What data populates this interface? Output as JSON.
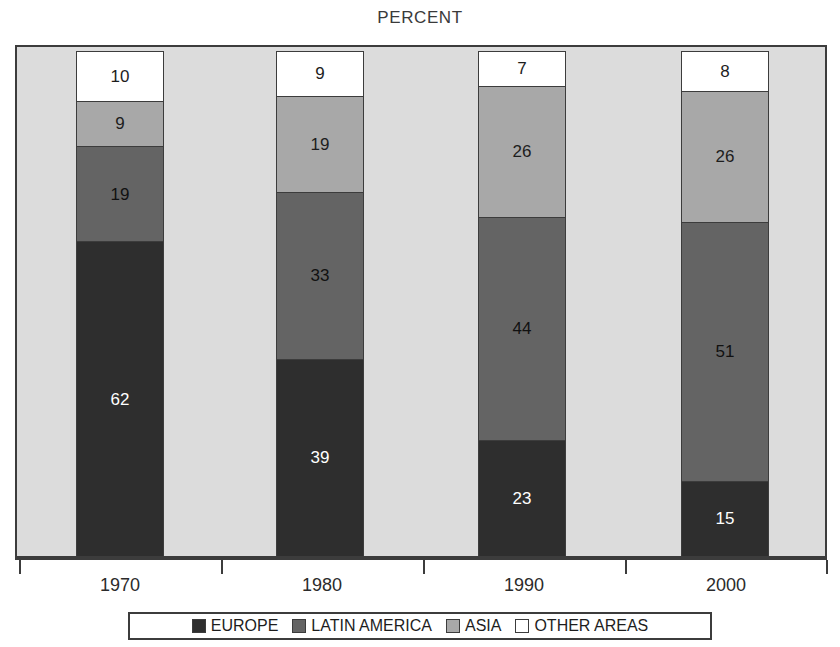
{
  "chart_data": {
    "type": "bar",
    "subtype": "stacked-bar-100-percent",
    "title": "PERCENT",
    "xlabel": "",
    "ylabel": "",
    "ylim": [
      0,
      100
    ],
    "grid": false,
    "legend_position": "bottom",
    "categories": [
      "1970",
      "1980",
      "1990",
      "2000"
    ],
    "series": [
      {
        "name": "EUROPE",
        "color": "#2e2e2e",
        "values": [
          62,
          39,
          23,
          15
        ]
      },
      {
        "name": "LATIN AMERICA",
        "color": "#646464",
        "values": [
          19,
          33,
          44,
          51
        ]
      },
      {
        "name": "ASIA",
        "color": "#a8a8a8",
        "values": [
          9,
          19,
          26,
          26
        ]
      },
      {
        "name": "OTHER AREAS",
        "color": "#ffffff",
        "values": [
          10,
          9,
          7,
          8
        ]
      }
    ],
    "stack_order_bottom_to_top": [
      "EUROPE",
      "LATIN AMERICA",
      "ASIA",
      "OTHER AREAS"
    ],
    "data_labels": {
      "1970": {
        "EUROPE": "62",
        "LATIN AMERICA": "19",
        "ASIA": "9",
        "OTHER AREAS": "10"
      },
      "1980": {
        "EUROPE": "39",
        "LATIN AMERICA": "33",
        "ASIA": "19",
        "OTHER AREAS": "9"
      },
      "1990": {
        "EUROPE": "23",
        "LATIN AMERICA": "44",
        "ASIA": "26",
        "OTHER AREAS": "7"
      },
      "2000": {
        "EUROPE": "15",
        "LATIN AMERICA": "51",
        "ASIA": "26",
        "OTHER AREAS": "8"
      }
    }
  },
  "title": {
    "text": "PERCENT"
  },
  "axis": {
    "ticks": [
      "1970",
      "1980",
      "1990",
      "2000"
    ]
  },
  "bars": [
    {
      "category": "1970",
      "segments": [
        {
          "name": "OTHER AREAS",
          "label": "10",
          "value": 10,
          "class": "seg-other"
        },
        {
          "name": "ASIA",
          "label": "9",
          "value": 9,
          "class": "seg-asia"
        },
        {
          "name": "LATIN AMERICA",
          "label": "19",
          "value": 19,
          "class": "seg-latin"
        },
        {
          "name": "EUROPE",
          "label": "62",
          "value": 62,
          "class": "seg-europe"
        }
      ]
    },
    {
      "category": "1980",
      "segments": [
        {
          "name": "OTHER AREAS",
          "label": "9",
          "value": 9,
          "class": "seg-other"
        },
        {
          "name": "ASIA",
          "label": "19",
          "value": 19,
          "class": "seg-asia"
        },
        {
          "name": "LATIN AMERICA",
          "label": "33",
          "value": 33,
          "class": "seg-latin"
        },
        {
          "name": "EUROPE",
          "label": "39",
          "value": 39,
          "class": "seg-europe"
        }
      ]
    },
    {
      "category": "1990",
      "segments": [
        {
          "name": "OTHER AREAS",
          "label": "7",
          "value": 7,
          "class": "seg-other"
        },
        {
          "name": "ASIA",
          "label": "26",
          "value": 26,
          "class": "seg-asia"
        },
        {
          "name": "LATIN AMERICA",
          "label": "44",
          "value": 44,
          "class": "seg-latin"
        },
        {
          "name": "EUROPE",
          "label": "23",
          "value": 23,
          "class": "seg-europe"
        }
      ]
    },
    {
      "category": "2000",
      "segments": [
        {
          "name": "OTHER AREAS",
          "label": "8",
          "value": 8,
          "class": "seg-other"
        },
        {
          "name": "ASIA",
          "label": "26",
          "value": 26,
          "class": "seg-asia"
        },
        {
          "name": "LATIN AMERICA",
          "label": "51",
          "value": 51,
          "class": "seg-latin"
        },
        {
          "name": "EUROPE",
          "label": "15",
          "value": 15,
          "class": "seg-europe"
        }
      ]
    }
  ],
  "legend": {
    "items": [
      {
        "label": "EUROPE",
        "color": "#2e2e2e"
      },
      {
        "label": "LATIN AMERICA",
        "color": "#646464"
      },
      {
        "label": "ASIA",
        "color": "#a8a8a8"
      },
      {
        "label": "OTHER AREAS",
        "color": "#ffffff"
      }
    ]
  },
  "colors": {
    "europe": "#2e2e2e",
    "latin_america": "#646464",
    "asia": "#a8a8a8",
    "other_areas": "#ffffff",
    "plot_background": "#dcdcdc",
    "frame": "#3c3c3c"
  }
}
